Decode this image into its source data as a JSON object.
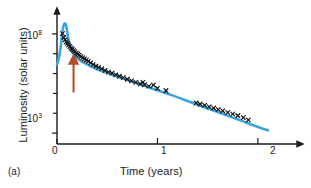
{
  "figure": {
    "panel_label": "(a)",
    "colors": {
      "curve": "#3ba7dc",
      "markers": "#111111",
      "arrow": "#b4512a",
      "axis": "#1a1a1a"
    }
  },
  "chart_data": {
    "type": "line",
    "title": "",
    "xlabel": "Time (years)",
    "ylabel": "Luminosity (solar units)",
    "yscale": "log",
    "xscale": "linear",
    "xlim": [
      0,
      2.25
    ],
    "ylim_exponent": [
      2.45,
      8.7
    ],
    "grid": false,
    "legend": null,
    "xticks": [
      0,
      1,
      2
    ],
    "xticklabels": [
      "0",
      "1",
      "2"
    ],
    "yticks_labeled": [
      {
        "exponent": 8,
        "label_mantissa": "10",
        "label_exponent": "8"
      },
      {
        "exponent": 3,
        "label_mantissa": "10",
        "label_exponent": "3"
      }
    ],
    "yticks_minor_exponents": [
      7,
      6,
      5,
      4
    ],
    "series": [
      {
        "name": "model-light-curve",
        "style": "solid-line",
        "color": "#3ba7dc",
        "x": [
          0.0,
          0.015,
          0.03,
          0.045,
          0.055,
          0.065,
          0.075,
          0.085,
          0.095,
          0.105,
          0.115,
          0.13,
          0.15,
          0.18,
          0.22,
          0.27,
          0.33,
          0.4,
          0.48,
          0.57,
          0.67,
          0.78,
          0.9,
          1.02,
          1.15,
          1.3,
          1.45,
          1.6,
          1.75,
          1.9,
          2.05,
          2.1
        ],
        "y_exponent": [
          6.45,
          6.7,
          7.1,
          7.7,
          8.15,
          8.42,
          8.52,
          8.5,
          8.32,
          8.0,
          7.7,
          7.4,
          7.12,
          6.9,
          6.7,
          6.54,
          6.38,
          6.22,
          6.06,
          5.9,
          5.72,
          5.53,
          5.33,
          5.12,
          4.9,
          4.62,
          4.34,
          4.06,
          3.78,
          3.5,
          3.22,
          3.14
        ]
      },
      {
        "name": "observed-data",
        "style": "x-markers",
        "color": "#111111",
        "x": [
          0.055,
          0.068,
          0.08,
          0.092,
          0.103,
          0.115,
          0.128,
          0.14,
          0.152,
          0.165,
          0.178,
          0.192,
          0.205,
          0.22,
          0.238,
          0.255,
          0.272,
          0.292,
          0.312,
          0.335,
          0.36,
          0.388,
          0.415,
          0.445,
          0.478,
          0.512,
          0.548,
          0.585,
          0.622,
          0.66,
          0.7,
          0.742,
          0.785,
          0.828,
          0.855,
          0.872,
          0.915,
          0.96,
          1.0,
          1.085,
          1.385,
          1.425,
          1.47,
          1.515,
          1.56,
          1.605,
          1.65,
          1.7,
          1.75,
          1.8,
          1.855,
          1.905
        ],
        "y_exponent": [
          8.02,
          7.82,
          7.7,
          7.6,
          7.52,
          7.44,
          7.36,
          7.28,
          7.22,
          7.16,
          7.1,
          7.04,
          6.98,
          6.92,
          6.86,
          6.8,
          6.74,
          6.68,
          6.62,
          6.54,
          6.46,
          6.38,
          6.32,
          6.24,
          6.16,
          6.08,
          6.02,
          5.94,
          5.87,
          5.8,
          5.72,
          5.64,
          5.56,
          5.48,
          5.56,
          5.44,
          5.36,
          5.42,
          5.26,
          5.14,
          4.52,
          4.46,
          4.4,
          4.33,
          4.26,
          4.19,
          4.12,
          4.04,
          3.96,
          3.88,
          3.78,
          3.66
        ]
      }
    ],
    "annotations": [
      {
        "name": "event-marker-arrow",
        "type": "up-arrow",
        "color": "#b4512a",
        "x": 0.165,
        "y_exponent_tail": 5.05,
        "y_exponent_head": 6.55
      }
    ]
  }
}
